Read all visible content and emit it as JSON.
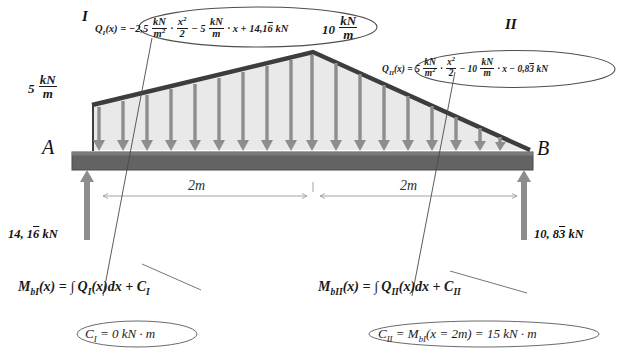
{
  "diagram": {
    "colors": {
      "beam_fill": "#636363",
      "beam_edge": "#3f3f3f",
      "load_fill": "#e9e9e9",
      "load_edge": "#4a4a4a",
      "arrow": "#8a8a8a",
      "reaction_arrow": "#8a8a8a",
      "leader_line": "#555555",
      "ellipse_stroke": "#555555",
      "text": "#111111",
      "dimension": "#8f8f8f",
      "background": "#ffffff"
    },
    "region_labels": {
      "left": "I",
      "right": "II"
    },
    "load": {
      "left_value": "5",
      "left_unit_num": "kN",
      "left_unit_den": "m",
      "peak_value": "10",
      "peak_unit_num": "kN",
      "peak_unit_den": "m"
    },
    "supports": {
      "left_point": "A",
      "right_point": "B",
      "left_reaction": "14, 16 kN",
      "left_reaction_parts": {
        "whole": "14, 1",
        "repeating": "6",
        "unit": " kN"
      },
      "right_reaction_parts": {
        "whole": "10, 8",
        "repeating": "3",
        "unit": " kN"
      }
    },
    "dimensions": {
      "span_left": "2m",
      "span_right": "2m"
    },
    "equations": {
      "q1": {
        "lhs": "Q",
        "lhs_sub": "I",
        "lhs_arg": "(x) =",
        "c1": "−2,5",
        "f1_num": "kN",
        "f1_den": "m",
        "f1_den_sup": "2",
        "dot1": "·",
        "f2_num": "x",
        "f2_num_sup": "2",
        "f2_den": "2",
        "c2": "− 5",
        "f3_num": "kN",
        "f3_den": "m",
        "dot2": "·",
        "var": "x",
        "c3": "+ 14,1",
        "rep": "6",
        "unit": "kN"
      },
      "q2": {
        "lhs": "Q",
        "lhs_sub": "II",
        "lhs_arg": "(x) =",
        "c1": "5",
        "f1_num": "kN",
        "f1_den": "m",
        "f1_den_sup": "2",
        "dot1": "·",
        "f2_num": "x",
        "f2_num_sup": "2",
        "f2_den": "2",
        "c2": "− 10",
        "f3_num": "kN",
        "f3_den": "m",
        "dot2": "·",
        "var": "x",
        "c3": "− 0,8",
        "rep": "3",
        "unit": "kN"
      },
      "m1": {
        "lhs": "M",
        "lhs_sub": "bI",
        "text": "(x) = ∫ Q",
        "q_sub": "I",
        "tail": "(x)dx + C",
        "tail_sub": "I"
      },
      "m2": {
        "lhs": "M",
        "lhs_sub": "bII",
        "text": "(x) = ∫ Q",
        "q_sub": "II",
        "tail": "(x)dx + C",
        "tail_sub": "II"
      },
      "c1": {
        "lhs": "C",
        "lhs_sub": "I",
        "rhs": " = 0 kN · m"
      },
      "c2": {
        "lhs": "C",
        "lhs_sub": "II",
        "mid": " = M",
        "mid_sub": "bI",
        "rhs": "(x = 2m) = 15 kN · m"
      }
    }
  }
}
